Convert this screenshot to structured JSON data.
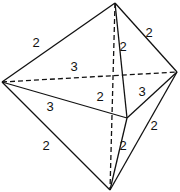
{
  "diagram": {
    "type": "octahedron-like polyhedron with edge lengths",
    "vertices": {
      "top": [
        115,
        3
      ],
      "left": [
        2,
        82
      ],
      "right": [
        177,
        72
      ],
      "middle": [
        127,
        118
      ],
      "bottom": [
        110,
        190
      ]
    },
    "edges": [
      {
        "from": "top",
        "to": "left",
        "label": "2",
        "style": "solid",
        "lx": 36,
        "ly": 47
      },
      {
        "from": "top",
        "to": "right",
        "label": "2",
        "style": "solid",
        "lx": 149,
        "ly": 37
      },
      {
        "from": "top",
        "to": "middle",
        "label": "2",
        "style": "solid",
        "lx": 123,
        "ly": 51
      },
      {
        "from": "top",
        "to": "bottom",
        "label": "2",
        "style": "dashed",
        "lx": 100,
        "ly": 101
      },
      {
        "from": "left",
        "to": "right",
        "label": "3",
        "style": "dashed",
        "lx": 74,
        "ly": 71
      },
      {
        "from": "left",
        "to": "middle",
        "label": "3",
        "style": "solid",
        "lx": 50,
        "ly": 111
      },
      {
        "from": "middle",
        "to": "right",
        "label": "3",
        "style": "solid",
        "lx": 142,
        "ly": 96
      },
      {
        "from": "left",
        "to": "bottom",
        "label": "2",
        "style": "solid",
        "lx": 46,
        "ly": 150
      },
      {
        "from": "middle",
        "to": "bottom",
        "label": "2",
        "style": "solid",
        "lx": 123,
        "ly": 150
      },
      {
        "from": "right",
        "to": "bottom",
        "label": "2",
        "style": "solid",
        "lx": 154,
        "ly": 130
      }
    ]
  }
}
